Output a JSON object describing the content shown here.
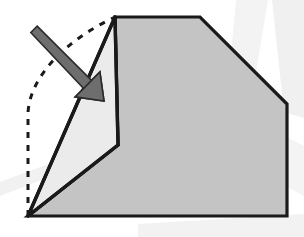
{
  "diagram": {
    "title": "Origami fold step diagram",
    "canvas": {
      "width": 304,
      "height": 237,
      "background": "#ffffff"
    },
    "colors": {
      "background": "#ffffff",
      "paper_main_fill": "#c4c4c4",
      "paper_flap_fill": "#ebebeb",
      "outline_stroke": "#1a1a1a",
      "dashed_stroke": "#1a1a1a",
      "arrow_fill": "#6e6e6e",
      "arrow_stroke": "#2b2b2b",
      "watermark_fill": "#f2f2f2"
    },
    "strokes": {
      "outline_width": 3.2,
      "fold_edge_width": 3.2,
      "dashed_width": 3.0,
      "dash_pattern": "6 7",
      "arrow_stroke_width": 1.6
    },
    "shapes": {
      "main_body": {
        "name": "main-paper-body",
        "fill": "#c4c4c4",
        "points": "115,17 200,17 287,104 287,216 28,216 118,145"
      },
      "folded_flap": {
        "name": "folded-flap-triangle",
        "fill": "#ebebeb",
        "points": "115,17 118,145 28,216"
      },
      "dashed_ghost_outline": {
        "name": "dashed-ghost-outline",
        "path": "M 28,216 L 28,113 C 30,74 70,38 115,17"
      },
      "fold_crease_vertical": {
        "name": "fold-crease-vertical-edge",
        "path": "M 115,17 L 118,145"
      },
      "flap_lower_edge": {
        "name": "flap-lower-fold-edge",
        "path": "M 118,145 L 28,216"
      },
      "flap_left_edge": {
        "name": "flap-left-fold-edge",
        "path": "M 115,17 L 28,216"
      }
    },
    "arrow": {
      "name": "fold-direction-arrow",
      "label": "fold-direction-arrow",
      "tail_x": 34,
      "tail_y": 29,
      "tip_x": 104,
      "tip_y": 101,
      "shaft_width": 9,
      "head_length": 26,
      "head_width": 24,
      "fill": "#6e6e6e",
      "stroke": "#2b2b2b",
      "direction": "down-right",
      "meaning": "fold the left corner over toward the body"
    },
    "vertices": [
      {
        "name": "apex-top-left",
        "x": 115,
        "y": 17
      },
      {
        "name": "top-right-of-flat-edge",
        "x": 200,
        "y": 17
      },
      {
        "name": "bevel-corner-right",
        "x": 287,
        "y": 104
      },
      {
        "name": "bottom-right-corner",
        "x": 287,
        "y": 216
      },
      {
        "name": "bottom-left-corner",
        "x": 28,
        "y": 216
      },
      {
        "name": "inner-fold-point",
        "x": 118,
        "y": 145
      }
    ],
    "watermarks": [
      {
        "name": "watermark-upper-right-band",
        "points": "236,0 268,0 252,96 228,86"
      },
      {
        "name": "watermark-right-vertical-band",
        "points": "272,0 304,0 304,118 284,112"
      },
      {
        "name": "watermark-right-lower-band",
        "points": "262,124 304,146 304,196 266,176"
      },
      {
        "name": "watermark-bottom-band",
        "points": "138,224 304,214 304,237 138,237"
      },
      {
        "name": "watermark-lower-left-sweep",
        "points": "0,182 70,156 78,166 0,196"
      }
    ]
  }
}
